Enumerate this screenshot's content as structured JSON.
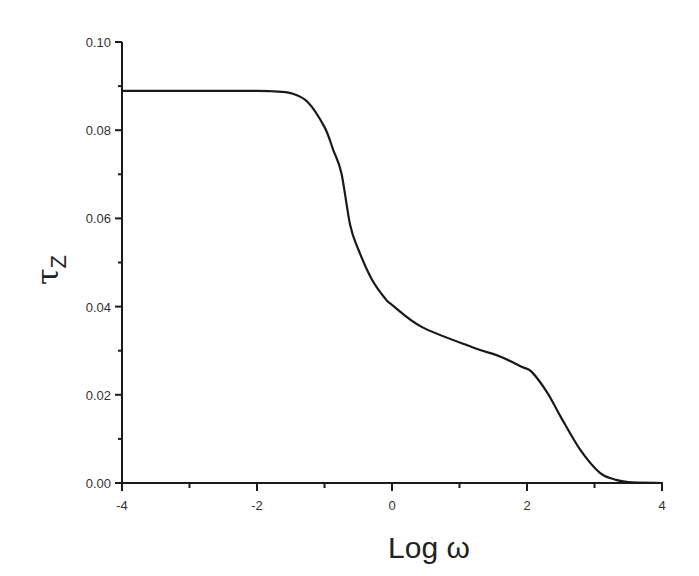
{
  "chart_data": {
    "type": "line",
    "title": "",
    "xlabel": "Log ω",
    "ylabel": "τZ",
    "ylabel_main": "τ",
    "ylabel_sub": "Z",
    "xlim": [
      -4,
      4
    ],
    "ylim": [
      0.0,
      0.1
    ],
    "grid": false,
    "legend": null,
    "x_ticks": [
      "-4",
      "-2",
      "0",
      "2",
      "4"
    ],
    "y_ticks": [
      "0.00",
      "0.02",
      "0.04",
      "0.06",
      "0.08",
      "0.10"
    ],
    "series": [
      {
        "name": "τZ",
        "color": "#1a1a1a",
        "x": [
          -4.0,
          -3.0,
          -2.0,
          -1.75,
          -1.5,
          -1.25,
          -1.0,
          -0.87,
          -0.75,
          -0.62,
          -0.5,
          -0.3,
          -0.1,
          0.0,
          0.44,
          1.19,
          1.6,
          1.93,
          2.07,
          2.3,
          2.5,
          2.79,
          3.08,
          3.3,
          3.5,
          4.0
        ],
        "y": [
          0.0889,
          0.0889,
          0.0889,
          0.0888,
          0.0884,
          0.0864,
          0.0807,
          0.0755,
          0.0703,
          0.0585,
          0.053,
          0.0462,
          0.0418,
          0.0404,
          0.0354,
          0.0308,
          0.0287,
          0.0263,
          0.0252,
          0.0205,
          0.015,
          0.0075,
          0.0023,
          0.0008,
          0.0002,
          0.0
        ]
      }
    ]
  }
}
